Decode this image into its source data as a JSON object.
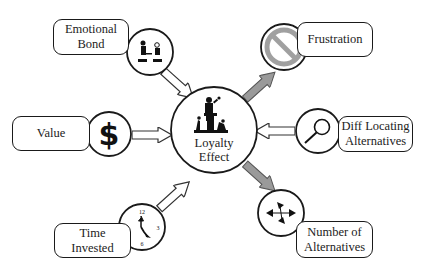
{
  "center": {
    "label_line1": "Loyalty",
    "label_line2": "Effect",
    "icon": "speaker-crowd-icon"
  },
  "factors": {
    "emotional_bond": {
      "line1": "Emotional",
      "line2": "Bond",
      "icon": "people-meeting-icon",
      "arrow": "inbound-hollow"
    },
    "value": {
      "line1": "Value",
      "icon": "dollar-sign-icon",
      "arrow": "inbound-hollow"
    },
    "time_invested": {
      "line1": "Time",
      "line2": "Invested",
      "icon": "clock-icon",
      "arrow": "inbound-hollow",
      "clock_numbers": [
        "12",
        "3",
        "6",
        "9"
      ]
    },
    "frustration": {
      "line1": "Frustration",
      "icon": "prohibited-icon",
      "arrow": "outbound-gray"
    },
    "diff_locating": {
      "line1": "Diff Locating",
      "line2": "Alternatives",
      "icon": "magnifier-icon",
      "arrow": "inbound-hollow"
    },
    "number_of_alternatives": {
      "line1": "Number of",
      "line2": "Alternatives",
      "icon": "four-arrows-icon",
      "arrow": "outbound-gray"
    }
  },
  "colors": {
    "stroke": "#1a1a1a",
    "gray_arrow_fill": "#9a9a9a",
    "prohibited_gray": "#a0a0a0",
    "background": "#ffffff"
  }
}
